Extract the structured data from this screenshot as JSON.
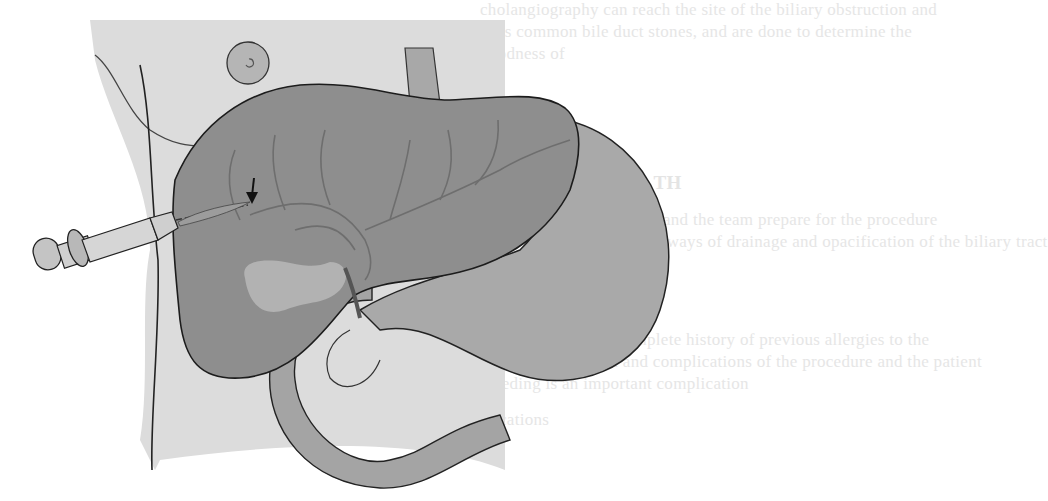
{
  "figure": {
    "style": "grayscale line illustration",
    "labels": [],
    "elements": [
      {
        "name": "syringe",
        "description": "syringe with plunger inserted from the right flank"
      },
      {
        "name": "needle",
        "description": "fine needle advancing into an intrahepatic bile duct"
      },
      {
        "name": "arrow",
        "description": "black arrow pointing down to needle tip in bile duct"
      },
      {
        "name": "liver",
        "description": "liver with branching bile ducts"
      },
      {
        "name": "gallbladder",
        "description": "gallbladder beneath the liver"
      },
      {
        "name": "stomach",
        "description": "stomach to the right of the liver"
      },
      {
        "name": "duodenum",
        "description": "looping duodenum / bowel"
      },
      {
        "name": "esophagus",
        "description": "esophagus entering above"
      },
      {
        "name": "umbilicus",
        "description": "circular nipple/umbilicus marker at top left"
      }
    ],
    "colors": {
      "body_bg": "#dcdcdc",
      "liver": "#8e8e8e",
      "stomach": "#a9a9a9",
      "duodenum": "#a4a4a4",
      "gallbladder": "#b2b2b2",
      "outline": "#2a2a2a",
      "ducts": "#6e6e6e",
      "syringe": "#c9c9c9"
    }
  },
  "background_text": {
    "legibility": "illegible faded bleed-through",
    "lines": [
      "cholangiography can reach the site of the biliary obstruction and",
      "sites common bile duct stones, and are done to determine the",
      "goodness of",
      "ERING TH",
      "patient and the team prepare for the procedure",
      "various ways of drainage and opacification of the biliary tract",
      "ATION",
      "the patient for a complete history of previous allergies to the",
      "contrast medium and complications of the procedure and the patient",
      "bleeding is an important complication",
      "complications"
    ]
  }
}
